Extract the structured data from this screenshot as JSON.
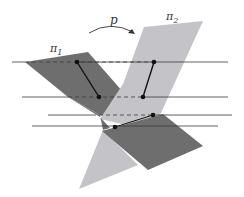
{
  "figure": {
    "width": 244,
    "height": 197,
    "labels": {
      "plane1": "π",
      "plane1_sub": "1",
      "plane2": "π",
      "plane2_sub": "2",
      "map": "p"
    },
    "colors": {
      "plane1_fill": "#6e6e6e",
      "plane2_fill": "#c4c4c8",
      "line": "#3a3a3a",
      "point": "#111111",
      "background": "#ffffff"
    }
  }
}
